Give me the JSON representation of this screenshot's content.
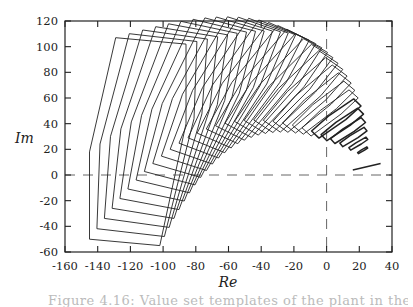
{
  "chart_data": {
    "type": "line",
    "subtype": "polygon-templates-complex-plane",
    "title": "",
    "xlabel": "Re",
    "ylabel": "Im",
    "xlim": [
      -160,
      40
    ],
    "ylim": [
      -60,
      120
    ],
    "xticks": [
      -160,
      -140,
      -120,
      -100,
      -80,
      -60,
      -40,
      -20,
      0,
      20,
      40
    ],
    "yticks": [
      -60,
      -40,
      -20,
      0,
      20,
      40,
      60,
      80,
      100,
      120
    ],
    "xtick_labels": [
      "-160",
      "-140",
      "-120",
      "-100",
      "-80",
      "-60",
      "-40",
      "-20",
      "0",
      "20",
      "40"
    ],
    "ytick_labels": [
      "-60",
      "-40",
      "-20",
      "0",
      "20",
      "40",
      "60",
      "80",
      "100",
      "120"
    ],
    "grid": false,
    "legend": null,
    "reference_lines": [
      {
        "orientation": "horizontal",
        "value": 0,
        "style": "dashed"
      },
      {
        "orientation": "vertical",
        "value": 0,
        "style": "dashed"
      }
    ],
    "series_description": "Sequence of nested value-set polygons (templates) in the complex plane, moving right along an arc and shrinking to line segments near Re 15-35, Im 5-35",
    "first_polygon": [
      [
        -129,
        107
      ],
      [
        -86,
        102
      ],
      [
        -86,
        40
      ],
      [
        -102,
        -55
      ],
      [
        -145,
        -50
      ],
      [
        -145,
        18
      ]
    ],
    "last_segment": [
      [
        16,
        4
      ],
      [
        33,
        9
      ]
    ],
    "polygon_count": 32,
    "sample_polygons": [
      {
        "index": 0,
        "vertices": [
          [
            -129,
            107
          ],
          [
            -86,
            102
          ],
          [
            -86,
            40
          ],
          [
            -102,
            -55
          ],
          [
            -145,
            -50
          ],
          [
            -145,
            18
          ]
        ]
      },
      {
        "index": 1,
        "vertices": [
          [
            -118,
            110
          ],
          [
            -76,
            106
          ],
          [
            -76,
            45
          ],
          [
            -92,
            -41
          ],
          [
            -134,
            -36
          ],
          [
            -134,
            26
          ]
        ]
      },
      {
        "index": 2,
        "vertices": [
          [
            -108,
            112
          ],
          [
            -67,
            109
          ],
          [
            -67,
            50
          ],
          [
            -82,
            -29
          ],
          [
            -123,
            -24
          ],
          [
            -123,
            32
          ]
        ]
      },
      {
        "index": 3,
        "vertices": [
          [
            -98,
            113
          ],
          [
            -58,
            111
          ],
          [
            -58,
            54
          ],
          [
            -72,
            -18
          ],
          [
            -112,
            -14
          ],
          [
            -112,
            37
          ]
        ]
      }
    ]
  },
  "caption": "Figure 4.16: Value set templates of the plant in the complex plane"
}
